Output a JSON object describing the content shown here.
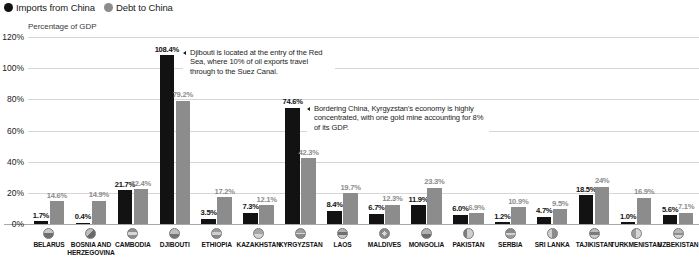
{
  "legend": {
    "items": [
      {
        "label": "Imports from China",
        "color": "#121212",
        "icon": "filled-circle-icon"
      },
      {
        "label": "Debt to China",
        "color": "#8c8c8c",
        "icon": "filled-circle-icon"
      }
    ]
  },
  "axis_title": "Percentage of GDP",
  "annotations": [
    {
      "id": "djibouti",
      "text": "Djibouti is located at the entry of the Red Sea, where 10% of oil exports travel through to the Suez Canal."
    },
    {
      "id": "kyrgyzstan",
      "text": "Bordering China, Kyrgyzstan's economy is highly concentrated, with one gold mine accounting for 8% of its GDP."
    }
  ],
  "chart_data": {
    "type": "bar",
    "title": "",
    "subtitle": "",
    "xlabel": "",
    "ylabel": "Percentage of GDP",
    "ylim": [
      0,
      120
    ],
    "ytick_labels": [
      "120%",
      "100%",
      "80%",
      "60%",
      "40%",
      "20%",
      "0%"
    ],
    "ytick_values": [
      120,
      100,
      80,
      60,
      40,
      20,
      0
    ],
    "grid": true,
    "legend_position": "top-left",
    "categories": [
      "BELARUS",
      "BOSNIA AND HERZEGOVINA",
      "CAMBODIA",
      "DJIBOUTI",
      "ETHIOPIA",
      "KAZAKHSTAN",
      "KYRGYZSTAN",
      "LAOS",
      "MALDIVES",
      "MONGOLIA",
      "PAKISTAN",
      "SERBIA",
      "SRI LANKA",
      "TAJIKISTAN",
      "TURKMENISTAN",
      "UZBEKISTAN"
    ],
    "series": [
      {
        "name": "Imports from China",
        "color": "#121212",
        "values": [
          1.7,
          0.4,
          21.7,
          108.4,
          3.5,
          7.3,
          74.6,
          8.4,
          6.7,
          11.9,
          6.0,
          1.2,
          4.7,
          18.5,
          1.0,
          5.6
        ],
        "labels": [
          "1.7%",
          "0.4%",
          "21.7%",
          "108.4%",
          "3.5%",
          "7.3%",
          "74.6%",
          "8.4%",
          "6.7%",
          "11.9%",
          "6.0%",
          "1.2%",
          "4.7%",
          "18.5%",
          "1.0%",
          "5.6%"
        ]
      },
      {
        "name": "Debt to China",
        "color": "#8c8c8c",
        "values": [
          14.6,
          14.9,
          22.4,
          79.2,
          17.2,
          12.1,
          42.3,
          19.7,
          12.3,
          23.3,
          6.9,
          10.9,
          9.5,
          24.0,
          16.9,
          7.1
        ],
        "labels": [
          "14.6%",
          "14.9%",
          "22.4%",
          "79.2%",
          "17.2%",
          "12.1%",
          "42.3%",
          "19.7%",
          "12.3%",
          "23.3%",
          "6.9%",
          "10.9%",
          "9.5%",
          "24%",
          "16.9%",
          "7.1%"
        ]
      }
    ]
  }
}
